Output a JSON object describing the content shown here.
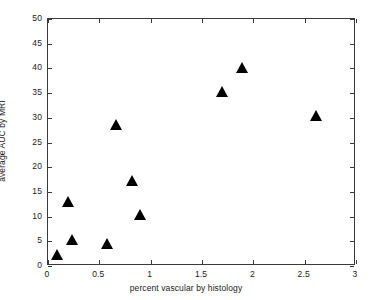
{
  "chart_data": {
    "type": "scatter",
    "title": "",
    "xlabel": "percent vascular by histology",
    "ylabel": "average AUC by MRI",
    "xlim": [
      0,
      3
    ],
    "ylim": [
      0,
      50
    ],
    "xticks": [
      "0",
      "0.5",
      "1",
      "1.5",
      "2",
      "2.5",
      "3"
    ],
    "xtick_values": [
      0,
      0.5,
      1,
      1.5,
      2,
      2.5,
      3
    ],
    "yticks": [
      "0",
      "5",
      "10",
      "15",
      "20",
      "25",
      "30",
      "35",
      "40",
      "45",
      "50"
    ],
    "ytick_values": [
      0,
      5,
      10,
      15,
      20,
      25,
      30,
      35,
      40,
      45,
      50
    ],
    "grid": false,
    "legend": null,
    "marker": "triangle-up",
    "marker_color": "#000000",
    "points": [
      {
        "x": 0.09,
        "y": 2.2
      },
      {
        "x": 0.2,
        "y": 13.0
      },
      {
        "x": 0.24,
        "y": 5.3
      },
      {
        "x": 0.58,
        "y": 4.4
      },
      {
        "x": 0.67,
        "y": 28.5
      },
      {
        "x": 0.82,
        "y": 17.2
      },
      {
        "x": 0.9,
        "y": 10.4
      },
      {
        "x": 1.7,
        "y": 35.3
      },
      {
        "x": 1.89,
        "y": 40.1
      },
      {
        "x": 2.62,
        "y": 30.4
      }
    ],
    "x": [
      0.09,
      0.2,
      0.24,
      0.58,
      0.67,
      0.82,
      0.9,
      1.7,
      1.89,
      2.62
    ],
    "values": [
      2.2,
      13.0,
      5.3,
      4.4,
      28.5,
      17.2,
      10.4,
      35.3,
      40.1,
      30.4
    ],
    "axis_color": "#3a3a3a"
  }
}
